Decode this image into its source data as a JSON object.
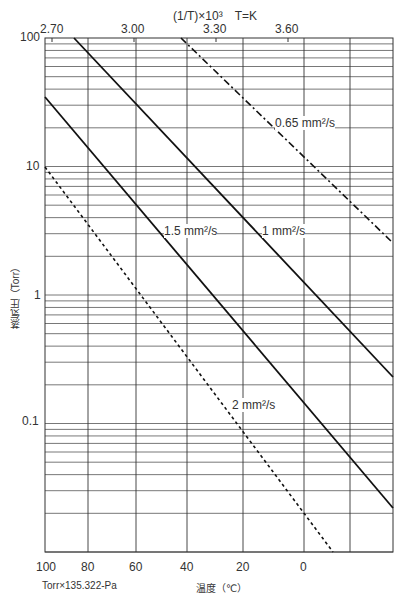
{
  "chart_data": {
    "type": "line",
    "title": "",
    "top_axis": {
      "label": "(1/T)×10³　T=K",
      "ticks": [
        "2.70",
        "3.00",
        "3.30",
        "3.60"
      ]
    },
    "xlabel": "温度（℃）",
    "ylabel": "蒸気圧（Torr）",
    "x_ticks": [
      "100",
      "80",
      "60",
      "40",
      "20",
      "0"
    ],
    "y_ticks": [
      "100",
      "10",
      "1",
      "0.1"
    ],
    "yscale": "log",
    "ylim": [
      0.01,
      100
    ],
    "xlim": [
      100,
      -20
    ],
    "grid": true,
    "footnote": "Torr×135.322=Pa",
    "series": [
      {
        "name": "0.65 mm²/s",
        "style": "dash-dot",
        "points": [
          [
            42,
            100
          ],
          [
            -20,
            2.5
          ]
        ]
      },
      {
        "name": "1 mm²/s",
        "style": "solid",
        "points": [
          [
            86.5,
            100
          ],
          [
            -20,
            0.23
          ]
        ]
      },
      {
        "name": "1.5 mm²/s",
        "style": "solid",
        "points": [
          [
            100,
            35
          ],
          [
            -20,
            0.022
          ]
        ]
      },
      {
        "name": "2 mm²/s",
        "style": "dotted",
        "points": [
          [
            100,
            10
          ],
          [
            -8,
            0.01
          ]
        ]
      }
    ]
  },
  "labels": {
    "top_axis_title": "(1/T)×10³　T=K",
    "top_ticks": [
      "2.70",
      "3.00",
      "3.30",
      "3.60"
    ],
    "x_ticks": [
      "100",
      "80",
      "60",
      "40",
      "20",
      "0"
    ],
    "y_ticks": [
      "100",
      "10",
      "1",
      "0.1"
    ],
    "xlabel": "温度（℃）",
    "ylabel": "蒸気圧（Torr）",
    "footnote": "Torr×135.322-Pa",
    "series_labels": [
      "0.65 mm²/s",
      "1 mm²/s",
      "1.5 mm²/s",
      "2 mm²/s"
    ]
  }
}
